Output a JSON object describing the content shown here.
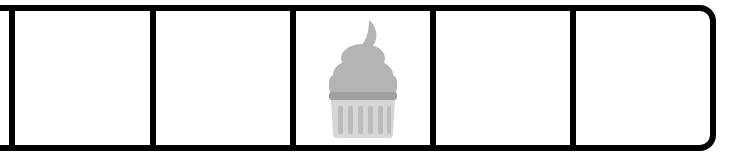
{
  "inventory_bar": {
    "slot_count": 5,
    "selected_slot": null,
    "border_color": "#000000",
    "background_color": "#ffffff",
    "slots": [
      {
        "index": 0,
        "item": null
      },
      {
        "index": 1,
        "item": null
      },
      {
        "index": 2,
        "item": {
          "name": "cupcake",
          "icon": "cupcake-icon",
          "state": "greyed-out"
        }
      },
      {
        "index": 3,
        "item": null
      },
      {
        "index": 4,
        "item": null
      }
    ]
  },
  "colors": {
    "frosting": "#b4b4b4",
    "frosting_band": "#a0a0a0",
    "wrapper": "#d6d6d6",
    "wrapper_stripes": "#bcbcbc"
  }
}
